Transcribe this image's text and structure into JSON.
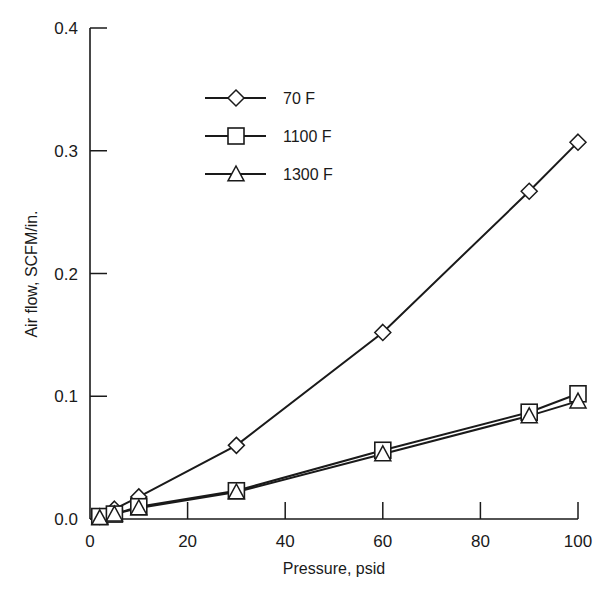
{
  "chart_data": {
    "type": "line",
    "title": "",
    "xlabel": "Pressure, psid",
    "ylabel": "Air flow, SCFM/in.",
    "xlim": [
      0,
      100
    ],
    "ylim": [
      0.0,
      0.4
    ],
    "xticks": [
      0,
      20,
      40,
      60,
      80,
      100
    ],
    "xtick_labels": [
      "0",
      "20",
      "40",
      "60",
      "80",
      "100"
    ],
    "yticks": [
      0.0,
      0.1,
      0.2,
      0.3,
      0.4
    ],
    "ytick_labels": [
      "0.0",
      "0.1",
      "0.2",
      "0.3",
      "0.4"
    ],
    "grid": false,
    "legend_position": "upper-left-inside",
    "series": [
      {
        "name": "70 F",
        "marker": "diamond",
        "x": [
          2,
          5,
          10,
          30,
          60,
          90,
          100
        ],
        "values": [
          0.002,
          0.008,
          0.018,
          0.06,
          0.152,
          0.267,
          0.307
        ]
      },
      {
        "name": "1100 F",
        "marker": "square",
        "x": [
          2,
          5,
          10,
          30,
          60,
          90,
          100
        ],
        "values": [
          0.002,
          0.004,
          0.01,
          0.023,
          0.056,
          0.087,
          0.102
        ]
      },
      {
        "name": "1300 F",
        "marker": "triangle",
        "x": [
          2,
          5,
          10,
          30,
          60,
          90,
          100
        ],
        "values": [
          0.001,
          0.004,
          0.009,
          0.022,
          0.053,
          0.084,
          0.096
        ]
      }
    ]
  },
  "legend": {
    "items": [
      {
        "label": "70 F",
        "marker": "diamond"
      },
      {
        "label": "1100 F",
        "marker": "square"
      },
      {
        "label": "1300 F",
        "marker": "triangle"
      }
    ]
  },
  "axes": {
    "x_title": "Pressure, psid",
    "y_title": "Air flow, SCFM/in."
  },
  "colors": {
    "ink": "#1a1a1a",
    "background": "#ffffff"
  }
}
